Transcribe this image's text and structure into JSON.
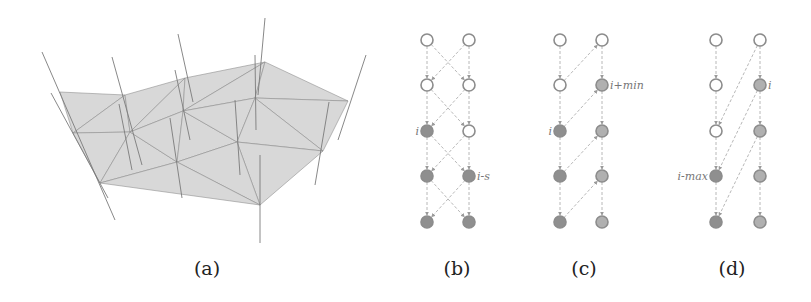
{
  "figure": {
    "panels": [
      {
        "id": "a",
        "caption": "(a)",
        "caption_x": 207,
        "description": "3D triangulated surface mesh with vertical lines through vertices",
        "mesh_vertices": [
          [
            60,
            92
          ],
          [
            125,
            95
          ],
          [
            185,
            78
          ],
          [
            265,
            62
          ],
          [
            348,
            101
          ],
          [
            73,
            133
          ],
          [
            130,
            132
          ],
          [
            183,
            111
          ],
          [
            255,
            98
          ],
          [
            323,
            151
          ],
          [
            100,
            183
          ],
          [
            177,
            162
          ],
          [
            237,
            142
          ],
          [
            260,
            205
          ]
        ],
        "mesh_triangles": [
          [
            0,
            1,
            5
          ],
          [
            1,
            6,
            5
          ],
          [
            1,
            2,
            6
          ],
          [
            2,
            7,
            6
          ],
          [
            2,
            3,
            7
          ],
          [
            3,
            8,
            7
          ],
          [
            3,
            4,
            8
          ],
          [
            4,
            9,
            8
          ],
          [
            5,
            6,
            10
          ],
          [
            6,
            11,
            10
          ],
          [
            6,
            7,
            11
          ],
          [
            7,
            12,
            11
          ],
          [
            7,
            8,
            12
          ],
          [
            8,
            9,
            12
          ],
          [
            9,
            13,
            12
          ],
          [
            11,
            12,
            13
          ],
          [
            10,
            11,
            13
          ]
        ],
        "vertical_lines": [
          [
            [
              42,
              52
            ],
            [
              115,
              220
            ]
          ],
          [
            [
              51,
              93
            ],
            [
              108,
              198
            ]
          ],
          [
            [
              112,
              57
            ],
            [
              142,
              165
            ]
          ],
          [
            [
              119,
              104
            ],
            [
              132,
              170
            ]
          ],
          [
            [
              178,
              34
            ],
            [
              193,
              102
            ]
          ],
          [
            [
              175,
              70
            ],
            [
              190,
              140
            ]
          ],
          [
            [
              170,
              118
            ],
            [
              182,
              198
            ]
          ],
          [
            [
              265,
              18
            ],
            [
              258,
              95
            ]
          ],
          [
            [
              255,
              55
            ],
            [
              256,
              130
            ]
          ],
          [
            [
              235,
              100
            ],
            [
              240,
              175
            ]
          ],
          [
            [
              329,
              102
            ],
            [
              315,
              185
            ]
          ],
          [
            [
              366,
              55
            ],
            [
              338,
              140
            ]
          ],
          [
            [
              260,
              155
            ],
            [
              260,
              243
            ]
          ]
        ],
        "fill_color": "#d8d8d8",
        "edge_color": "#8a8a8a"
      },
      {
        "id": "b",
        "caption": "(b)",
        "caption_x": 457,
        "columns_x": [
          427,
          469
        ],
        "rows_y": [
          40,
          85,
          131,
          176,
          222
        ],
        "nodes": [
          {
            "col": 0,
            "row": 0,
            "filled": false
          },
          {
            "col": 1,
            "row": 0,
            "filled": false
          },
          {
            "col": 0,
            "row": 1,
            "filled": false
          },
          {
            "col": 1,
            "row": 1,
            "filled": false
          },
          {
            "col": 0,
            "row": 2,
            "filled": true,
            "label": "i",
            "label_side": "left"
          },
          {
            "col": 1,
            "row": 2,
            "filled": false
          },
          {
            "col": 0,
            "row": 3,
            "filled": true
          },
          {
            "col": 1,
            "row": 3,
            "filled": true,
            "label": "i-s",
            "label_side": "right"
          },
          {
            "col": 0,
            "row": 4,
            "filled": true
          },
          {
            "col": 1,
            "row": 4,
            "filled": true
          }
        ],
        "edges": [
          [
            [
              0,
              0
            ],
            [
              0,
              1
            ]
          ],
          [
            [
              0,
              1
            ],
            [
              0,
              2
            ]
          ],
          [
            [
              0,
              2
            ],
            [
              0,
              3
            ]
          ],
          [
            [
              0,
              3
            ],
            [
              0,
              4
            ]
          ],
          [
            [
              1,
              0
            ],
            [
              1,
              1
            ]
          ],
          [
            [
              1,
              1
            ],
            [
              1,
              2
            ]
          ],
          [
            [
              1,
              2
            ],
            [
              1,
              3
            ]
          ],
          [
            [
              1,
              3
            ],
            [
              1,
              4
            ]
          ],
          [
            [
              0,
              0
            ],
            [
              1,
              1
            ]
          ],
          [
            [
              1,
              0
            ],
            [
              0,
              1
            ]
          ],
          [
            [
              0,
              1
            ],
            [
              1,
              2
            ]
          ],
          [
            [
              1,
              1
            ],
            [
              0,
              2
            ]
          ],
          [
            [
              0,
              2
            ],
            [
              1,
              3
            ]
          ],
          [
            [
              1,
              2
            ],
            [
              0,
              3
            ]
          ],
          [
            [
              0,
              3
            ],
            [
              1,
              4
            ]
          ],
          [
            [
              1,
              3
            ],
            [
              0,
              4
            ]
          ]
        ]
      },
      {
        "id": "c",
        "caption": "(c)",
        "caption_x": 584,
        "columns_x": [
          560,
          602
        ],
        "rows_y": [
          40,
          85,
          131,
          176,
          222
        ],
        "nodes": [
          {
            "col": 0,
            "row": 0,
            "filled": false
          },
          {
            "col": 1,
            "row": 0,
            "filled": false
          },
          {
            "col": 0,
            "row": 1,
            "filled": false
          },
          {
            "col": 1,
            "row": 1,
            "filled": true,
            "light": true,
            "label": "i+min",
            "label_side": "right"
          },
          {
            "col": 0,
            "row": 2,
            "filled": true,
            "label": "i",
            "label_side": "left"
          },
          {
            "col": 1,
            "row": 2,
            "filled": true,
            "light": true
          },
          {
            "col": 0,
            "row": 3,
            "filled": true
          },
          {
            "col": 1,
            "row": 3,
            "filled": true,
            "light": true
          },
          {
            "col": 0,
            "row": 4,
            "filled": true
          },
          {
            "col": 1,
            "row": 4,
            "filled": true,
            "light": true
          }
        ],
        "edges": [
          [
            [
              0,
              0
            ],
            [
              0,
              1
            ]
          ],
          [
            [
              0,
              1
            ],
            [
              0,
              2
            ]
          ],
          [
            [
              0,
              2
            ],
            [
              0,
              3
            ]
          ],
          [
            [
              0,
              3
            ],
            [
              0,
              4
            ]
          ],
          [
            [
              1,
              0
            ],
            [
              1,
              1
            ]
          ],
          [
            [
              1,
              1
            ],
            [
              1,
              2
            ]
          ],
          [
            [
              1,
              2
            ],
            [
              1,
              3
            ]
          ],
          [
            [
              1,
              3
            ],
            [
              1,
              4
            ]
          ],
          [
            [
              0,
              1
            ],
            [
              1,
              0
            ]
          ],
          [
            [
              0,
              2
            ],
            [
              1,
              1
            ]
          ],
          [
            [
              0,
              3
            ],
            [
              1,
              2
            ]
          ],
          [
            [
              0,
              4
            ],
            [
              1,
              3
            ]
          ]
        ]
      },
      {
        "id": "d",
        "caption": "(d)",
        "caption_x": 732,
        "columns_x": [
          716,
          760
        ],
        "rows_y": [
          40,
          85,
          131,
          176,
          222
        ],
        "nodes": [
          {
            "col": 0,
            "row": 0,
            "filled": false
          },
          {
            "col": 1,
            "row": 0,
            "filled": false
          },
          {
            "col": 0,
            "row": 1,
            "filled": false
          },
          {
            "col": 1,
            "row": 1,
            "filled": true,
            "light": true,
            "label": "i",
            "label_side": "right"
          },
          {
            "col": 0,
            "row": 2,
            "filled": false
          },
          {
            "col": 1,
            "row": 2,
            "filled": true,
            "light": true
          },
          {
            "col": 0,
            "row": 3,
            "filled": true,
            "label": "i-max",
            "label_side": "left"
          },
          {
            "col": 1,
            "row": 3,
            "filled": true,
            "light": true
          },
          {
            "col": 0,
            "row": 4,
            "filled": true
          },
          {
            "col": 1,
            "row": 4,
            "filled": true,
            "light": true
          }
        ],
        "edges": [
          [
            [
              0,
              0
            ],
            [
              0,
              1
            ]
          ],
          [
            [
              0,
              1
            ],
            [
              0,
              2
            ]
          ],
          [
            [
              0,
              2
            ],
            [
              0,
              3
            ]
          ],
          [
            [
              0,
              3
            ],
            [
              0,
              4
            ]
          ],
          [
            [
              1,
              0
            ],
            [
              1,
              1
            ]
          ],
          [
            [
              1,
              1
            ],
            [
              1,
              2
            ]
          ],
          [
            [
              1,
              2
            ],
            [
              1,
              3
            ]
          ],
          [
            [
              1,
              3
            ],
            [
              1,
              4
            ]
          ],
          [
            [
              1,
              0
            ],
            [
              0,
              2
            ]
          ],
          [
            [
              1,
              1
            ],
            [
              0,
              3
            ]
          ],
          [
            [
              1,
              2
            ],
            [
              0,
              4
            ]
          ]
        ]
      }
    ],
    "colors": {
      "node_stroke": "#8c8c8c",
      "node_fill_dark": "#8f8f8f",
      "node_fill_light": "#b0b0b0",
      "node_hollow_fill": "#ffffff",
      "edge": "#b8b8b8",
      "caption": "#222222"
    }
  }
}
